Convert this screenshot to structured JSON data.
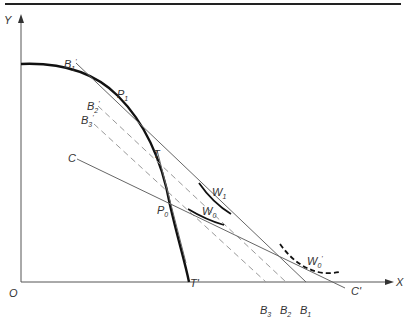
{
  "diagram": {
    "axes": {
      "y_label": "Y",
      "x_label": "X",
      "origin_label": "O"
    },
    "points": {
      "p1": {
        "label": "P",
        "sub": "1"
      },
      "p0": {
        "label": "P",
        "sub": "0"
      }
    },
    "tangent": {
      "top_label": "T",
      "bottom_label": "T'"
    },
    "budget_lines": [
      {
        "id": "b1",
        "top_label": "B",
        "top_sub": "1",
        "bottom_label": "B",
        "bottom_sub": "1",
        "style": "solid"
      },
      {
        "id": "b2",
        "top_label": "B",
        "top_sub": "2",
        "bottom_label": "B",
        "bottom_sub": "2",
        "style": "dashed"
      },
      {
        "id": "b3",
        "top_label": "B",
        "top_sub": "3",
        "bottom_label": "B",
        "bottom_sub": "3",
        "style": "dashed"
      }
    ],
    "c_line": {
      "left_label": "C",
      "right_label": "C'"
    },
    "indifference_curves": [
      {
        "id": "w1",
        "label": "W",
        "sub": "1",
        "style": "solid"
      },
      {
        "id": "w0",
        "label": "W",
        "sub": "0",
        "style": "solid"
      },
      {
        "id": "w0p",
        "label": "W",
        "sub": "0",
        "prime": "'",
        "style": "dashed"
      }
    ],
    "prime_mark": "'"
  }
}
